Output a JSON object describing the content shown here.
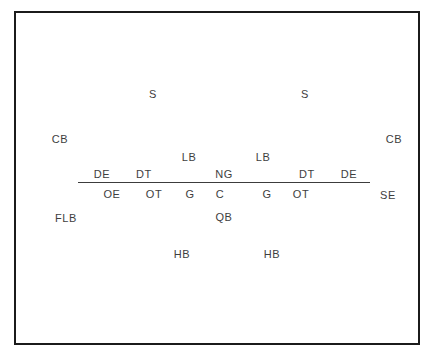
{
  "diagram": {
    "frame": {
      "border_color": "#1b1b1b",
      "background_color": "#ffffff"
    },
    "scrimmage_line": {
      "name": "line-of-scrimmage",
      "color": "#3c3c3c",
      "x_start": 76,
      "x_end": 368,
      "y": 180
    },
    "text_color": "#3e3e3e",
    "players": [
      {
        "id": "safety-left",
        "label": "S",
        "x": 151,
        "y": 92,
        "unit": "defense",
        "row": "deep-secondary"
      },
      {
        "id": "safety-right",
        "label": "S",
        "x": 303,
        "y": 92,
        "unit": "defense",
        "row": "deep-secondary"
      },
      {
        "id": "cornerback-left",
        "label": "CB",
        "x": 58,
        "y": 137,
        "unit": "defense",
        "row": "secondary"
      },
      {
        "id": "cornerback-right",
        "label": "CB",
        "x": 392,
        "y": 137,
        "unit": "defense",
        "row": "secondary"
      },
      {
        "id": "linebacker-left",
        "label": "LB",
        "x": 187,
        "y": 155,
        "unit": "defense",
        "row": "linebackers"
      },
      {
        "id": "linebacker-right",
        "label": "LB",
        "x": 261,
        "y": 155,
        "unit": "defense",
        "row": "linebackers"
      },
      {
        "id": "defensive-end-left",
        "label": "DE",
        "x": 100,
        "y": 172,
        "unit": "defense",
        "row": "defensive-line"
      },
      {
        "id": "defensive-tackle-left",
        "label": "DT",
        "x": 142,
        "y": 172,
        "unit": "defense",
        "row": "defensive-line"
      },
      {
        "id": "nose-guard",
        "label": "NG",
        "x": 222,
        "y": 172,
        "unit": "defense",
        "row": "defensive-line"
      },
      {
        "id": "defensive-tackle-right",
        "label": "DT",
        "x": 305,
        "y": 172,
        "unit": "defense",
        "row": "defensive-line"
      },
      {
        "id": "defensive-end-right",
        "label": "DE",
        "x": 347,
        "y": 172,
        "unit": "defense",
        "row": "defensive-line"
      },
      {
        "id": "offensive-end",
        "label": "OE",
        "x": 110,
        "y": 192,
        "unit": "offense",
        "row": "offensive-line"
      },
      {
        "id": "offensive-tackle-left",
        "label": "OT",
        "x": 152,
        "y": 192,
        "unit": "offense",
        "row": "offensive-line"
      },
      {
        "id": "guard-left",
        "label": "G",
        "x": 188,
        "y": 192,
        "unit": "offense",
        "row": "offensive-line"
      },
      {
        "id": "center",
        "label": "C",
        "x": 218,
        "y": 192,
        "unit": "offense",
        "row": "offensive-line"
      },
      {
        "id": "guard-right",
        "label": "G",
        "x": 265,
        "y": 192,
        "unit": "offense",
        "row": "offensive-line"
      },
      {
        "id": "offensive-tackle-right",
        "label": "OT",
        "x": 299,
        "y": 192,
        "unit": "offense",
        "row": "offensive-line"
      },
      {
        "id": "split-end",
        "label": "SE",
        "x": 386,
        "y": 193,
        "unit": "offense",
        "row": "offensive-line"
      },
      {
        "id": "flanker-back",
        "label": "FLB",
        "x": 64,
        "y": 216,
        "unit": "offense",
        "row": "backfield"
      },
      {
        "id": "quarterback",
        "label": "QB",
        "x": 222,
        "y": 215,
        "unit": "offense",
        "row": "backfield"
      },
      {
        "id": "halfback-left",
        "label": "HB",
        "x": 180,
        "y": 252,
        "unit": "offense",
        "row": "backfield"
      },
      {
        "id": "halfback-right",
        "label": "HB",
        "x": 270,
        "y": 252,
        "unit": "offense",
        "row": "backfield"
      }
    ]
  }
}
